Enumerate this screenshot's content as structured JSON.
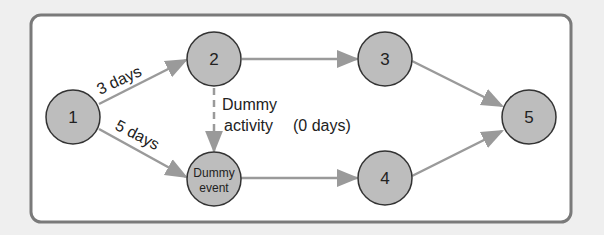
{
  "diagram": {
    "type": "activity-on-arrow network",
    "nodes": [
      {
        "id": "1",
        "label": "1"
      },
      {
        "id": "2",
        "label": "2"
      },
      {
        "id": "3",
        "label": "3"
      },
      {
        "id": "4",
        "label": "4"
      },
      {
        "id": "5",
        "label": "5"
      },
      {
        "id": "dummy",
        "label_line1": "Dummy",
        "label_line2": "event"
      }
    ],
    "edges": [
      {
        "from": "1",
        "to": "2",
        "label": "3 days"
      },
      {
        "from": "1",
        "to": "dummy",
        "label": "5 days"
      },
      {
        "from": "2",
        "to": "dummy",
        "label_line1": "Dummy",
        "label_line2": "activity",
        "label_extra": "(0 days)",
        "style": "dashed"
      },
      {
        "from": "2",
        "to": "3"
      },
      {
        "from": "dummy",
        "to": "4"
      },
      {
        "from": "3",
        "to": "5"
      },
      {
        "from": "4",
        "to": "5"
      }
    ],
    "colors": {
      "background": "#efefef",
      "frame": "#7a7a7a",
      "node_fill": "#bdbdbd",
      "node_stroke": "#333333",
      "arrow": "#9a9a9a"
    }
  }
}
